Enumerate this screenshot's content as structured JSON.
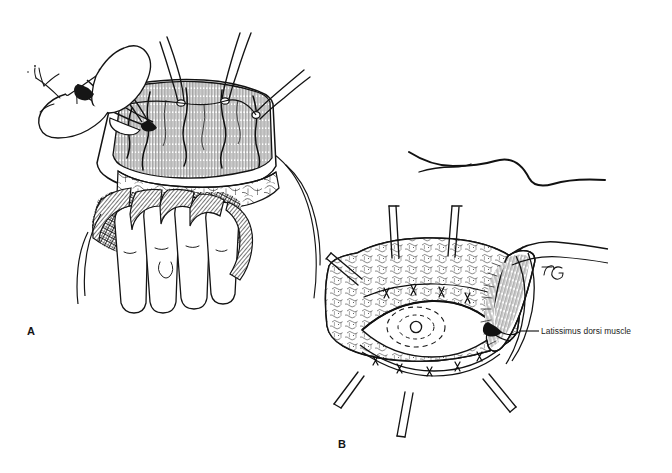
{
  "figure": {
    "kind": "surgical-line-illustration",
    "style": "pen-and-ink hatching, black on white",
    "background_color": "#ffffff",
    "ink_color": "#111111",
    "width": 672,
    "height": 473
  },
  "panels": [
    {
      "id": "A",
      "letter": "A",
      "title": "",
      "region": {
        "x": 10,
        "y": 25,
        "width": 290,
        "height": 295
      },
      "description": "Surgical field: skin edges elevated by wire retractor hooks, gloved hand with four fingers elevating the flap, forceps grasping tissue at upper left, muscle surface shown with dense vertical hatching above a cobblestoned subcutaneous fat layer.",
      "elements": [
        "retractor-hooks",
        "skin-edge",
        "muscle-flap-hatched",
        "subcutaneous-fat-cobblestone",
        "surgeon-gloved-hand",
        "forceps",
        "body-contour-lines"
      ]
    },
    {
      "id": "B",
      "letter": "B",
      "title": "",
      "region": {
        "x": 335,
        "y": 145,
        "width": 280,
        "height": 295
      },
      "description": "Closed view of the donor site: wavy body contour above, hexagonal wound opening held open by six retractors, surrounding fat shown in stippled texture, central lens-shaped incision with dashed circular marking, latissimus dorsi muscle flap folded at the right edge.",
      "elements": [
        "body-contour-curve",
        "retractors",
        "fat-stipple-texture",
        "oval-incision",
        "dashed-circle-marking",
        "latissimus-dorsi-flap",
        "suture-line",
        "artist-signature"
      ]
    }
  ],
  "labels": [
    {
      "id": "latissimus-dorsi-muscle",
      "text": "Latissimus dorsi muscle",
      "panel": "B",
      "text_anchor": {
        "x": 541,
        "y": 331
      },
      "leader_line": {
        "from": {
          "x": 519,
          "y": 331
        },
        "to": {
          "x": 539,
          "y": 331
        }
      }
    }
  ],
  "panel_letters": [
    {
      "id": "A",
      "text": "A",
      "x": 31,
      "y": 331
    },
    {
      "id": "B",
      "text": "B",
      "x": 342,
      "y": 444
    }
  ],
  "signature": {
    "id": "artist-signature",
    "text": "JG",
    "x": 548,
    "y": 271
  },
  "colors": {
    "ink": "#111111",
    "ink_light": "#4a4a4a",
    "paper": "#ffffff",
    "label_text": "#1a1a1a"
  }
}
